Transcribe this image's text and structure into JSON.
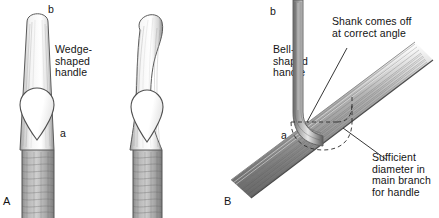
{
  "figure": {
    "background_color": "#ffffff",
    "ink_color": "#141414"
  },
  "panels": [
    {
      "key": "A",
      "label": "A",
      "caption": "Wedge-\nshaped\nhandle",
      "markers": [
        {
          "key": "b",
          "label": "b"
        },
        {
          "key": "a",
          "label": "a"
        }
      ]
    },
    {
      "key": "B",
      "label": "B",
      "caption": "Bell-\nshaped\nhandle",
      "markers": [
        {
          "key": "b",
          "label": "b"
        },
        {
          "key": "a",
          "label": "a"
        }
      ]
    },
    {
      "key": "C",
      "annotations": [
        {
          "key": "shank",
          "text": "Shank comes off\nat correct angle"
        },
        {
          "key": "diameter",
          "text": "Sufficient\ndiameter in\nmain branch\nfor handle"
        }
      ]
    }
  ]
}
